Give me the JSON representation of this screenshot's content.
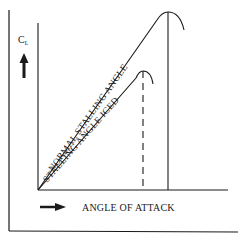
{
  "diagram": {
    "y_axis_label": "C",
    "y_axis_subscript": "L",
    "x_axis_label": "ANGLE OF ATTACK",
    "curves": [
      {
        "name": "normal",
        "label": "NORMAL STALLING ANGLE",
        "stall_marker": "solid"
      },
      {
        "name": "iced",
        "label": "STALLING ANGLE ICED",
        "stall_marker": "dashed"
      }
    ],
    "icons": {
      "y_arrow": "arrow-up-icon",
      "x_arrow": "arrow-right-icon"
    },
    "colors": {
      "line": "#1a1a1a",
      "background": "#ffffff"
    }
  }
}
